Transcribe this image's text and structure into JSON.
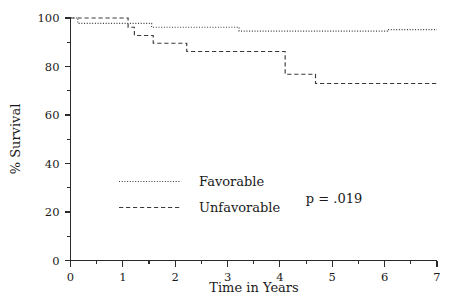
{
  "chart_data": {
    "type": "line",
    "title": "",
    "subtitle": "",
    "xlabel": "Time in Years",
    "ylabel": "% Survival",
    "xlim": [
      0,
      7
    ],
    "ylim": [
      0,
      100
    ],
    "xticks": [
      0,
      1,
      2,
      3,
      4,
      5,
      6,
      7
    ],
    "xtick_labels": [
      "0",
      "1",
      "2",
      "3",
      "4",
      "5",
      "6",
      "7"
    ],
    "xminor_ticks": [
      0.5,
      1.5,
      2.5,
      3.5,
      4.5,
      5.5,
      6.5
    ],
    "yticks": [
      0,
      20,
      40,
      60,
      80,
      100
    ],
    "ytick_labels": [
      "0",
      "20",
      "40",
      "60",
      "80",
      "100"
    ],
    "yminor_ticks": [
      10,
      30,
      50,
      70,
      90
    ],
    "grid": false,
    "legend_position": "center-left",
    "annotations": [
      {
        "name": "p-value",
        "text": "p = .019",
        "x": 5.05,
        "y": 26
      }
    ],
    "series": [
      {
        "name": "Favorable",
        "style": "dotted",
        "color": "#3a3a3a",
        "steps": [
          {
            "x": 0.0,
            "y": 100.0
          },
          {
            "x": 0.14,
            "y": 100.0
          },
          {
            "x": 0.14,
            "y": 97.8
          },
          {
            "x": 1.12,
            "y": 97.8
          },
          {
            "x": 1.12,
            "y": 97.8
          },
          {
            "x": 1.55,
            "y": 97.8
          },
          {
            "x": 1.55,
            "y": 96.2
          },
          {
            "x": 3.22,
            "y": 96.2
          },
          {
            "x": 3.22,
            "y": 94.6
          },
          {
            "x": 6.05,
            "y": 94.6
          },
          {
            "x": 6.05,
            "y": 95.2
          },
          {
            "x": 7.0,
            "y": 95.2
          }
        ]
      },
      {
        "name": "Unfavorable",
        "style": "dashed",
        "color": "#3a3a3a",
        "steps": [
          {
            "x": 0.0,
            "y": 100.0
          },
          {
            "x": 1.1,
            "y": 100.0
          },
          {
            "x": 1.1,
            "y": 96.2
          },
          {
            "x": 1.22,
            "y": 96.2
          },
          {
            "x": 1.22,
            "y": 92.8
          },
          {
            "x": 1.58,
            "y": 92.8
          },
          {
            "x": 1.58,
            "y": 89.6
          },
          {
            "x": 2.22,
            "y": 89.6
          },
          {
            "x": 2.22,
            "y": 86.2
          },
          {
            "x": 3.9,
            "y": 86.2
          },
          {
            "x": 3.9,
            "y": 86.2
          },
          {
            "x": 4.1,
            "y": 86.2
          },
          {
            "x": 4.1,
            "y": 76.8
          },
          {
            "x": 4.68,
            "y": 76.8
          },
          {
            "x": 4.68,
            "y": 73.0
          },
          {
            "x": 7.0,
            "y": 73.0
          }
        ]
      }
    ]
  },
  "legend": {
    "entries": [
      {
        "label": "Favorable",
        "style": "dotted"
      },
      {
        "label": "Unfavorable",
        "style": "dashed"
      }
    ]
  },
  "axes": {
    "x_title": "Time in Years",
    "y_title": "% Survival"
  }
}
